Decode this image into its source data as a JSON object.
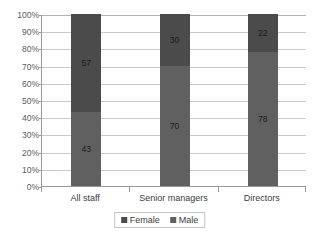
{
  "chart_data": {
    "type": "bar",
    "variant": "100% stacked column",
    "title": "",
    "xlabel": "",
    "ylabel": "",
    "ylim": [
      0,
      100
    ],
    "y_tick_labels": [
      "0%",
      "10%",
      "20%",
      "30%",
      "40%",
      "50%",
      "60%",
      "70%",
      "80%",
      "90%",
      "100%"
    ],
    "y_tick_values": [
      0,
      10,
      20,
      30,
      40,
      50,
      60,
      70,
      80,
      90,
      100
    ],
    "grid": true,
    "legend_position": "bottom-center",
    "categories": [
      "All staff",
      "Senior managers",
      "Directors"
    ],
    "series": [
      {
        "name": "Male",
        "color": "#606060",
        "stack_position": "bottom",
        "values": [
          43,
          70,
          78
        ],
        "labels": [
          "43",
          "70",
          "78"
        ]
      },
      {
        "name": "Female",
        "color": "#4b4b4b",
        "stack_position": "top",
        "values": [
          57,
          30,
          22
        ],
        "labels": [
          "57",
          "30",
          "22"
        ]
      }
    ]
  },
  "legend": {
    "items": [
      {
        "label": "Female",
        "marker": "square-marker-icon"
      },
      {
        "label": "Male",
        "marker": "square-marker-icon"
      }
    ]
  },
  "colors": {
    "female": "#4b4b4b",
    "male": "#606060",
    "gridline": "#c9c9c9",
    "axis": "#9a9a9a",
    "text": "#3c3c3c",
    "background": "#ffffff"
  }
}
